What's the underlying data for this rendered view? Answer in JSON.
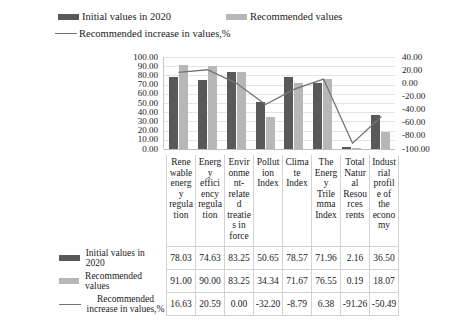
{
  "legend": {
    "items": [
      {
        "label": "Initial values in 2020",
        "marker": "bar-swatch-dark",
        "color": "#595959"
      },
      {
        "label": "Recommended values",
        "marker": "bar-swatch-light",
        "color": "#b7b7b7"
      },
      {
        "label": "Recommended increase in values,%",
        "marker": "line-swatch",
        "color": "#737373"
      }
    ]
  },
  "table": {
    "row_headers": [
      "Initial values in 2020",
      "Recommended values",
      "Recommended increase in values,%"
    ]
  },
  "chart_data": {
    "type": "bar",
    "title": "",
    "xlabel": "",
    "ylabel": "",
    "grid": true,
    "legend_position": "top",
    "categories": [
      "Renewable energy regulation",
      "Energy efficiency regulation",
      "Environment-related treaties in force",
      "Pollution Index",
      "Climate Index",
      "The Energy Trilemma Index",
      "Total Natural Resources rents",
      "Industrial profile of the economy"
    ],
    "category_labels_wrapped": [
      "Rene\nwable\nenerg\ny\nregula\ntion",
      "Energ\ny\neffici\nency\nregula\ntion",
      "Envir\nonme\nnt-\nrelate\nd\ntreatie\ns in\nforce",
      "Pollut\nion\nIndex",
      "Clima\nte\nIndex",
      "The\nEnerg\ny\nTrile\nmma\nIndex",
      "Total\nNatur\nal\nResou\nrces\nrents",
      "Indust\nrial\nprofil\ne of\nthe\necono\nmy"
    ],
    "series": [
      {
        "name": "Initial values in 2020",
        "type": "bar",
        "axis": "left",
        "color": "#595959",
        "values": [
          78.03,
          74.63,
          83.25,
          50.65,
          78.57,
          71.96,
          2.16,
          36.5
        ]
      },
      {
        "name": "Recommended values",
        "type": "bar",
        "axis": "left",
        "color": "#b7b7b7",
        "values": [
          91.0,
          90.0,
          83.25,
          34.34,
          71.67,
          76.55,
          0.19,
          18.07
        ]
      },
      {
        "name": "Recommended increase in values,%",
        "type": "line",
        "axis": "right",
        "color": "#737373",
        "values": [
          16.63,
          20.59,
          0.0,
          -32.2,
          -8.79,
          6.38,
          -91.26,
          -50.49
        ]
      }
    ],
    "left_axis": {
      "min": 0.0,
      "max": 100.0,
      "step": 10.0,
      "ticks": [
        "100.00",
        "90.00",
        "80.00",
        "70.00",
        "60.00",
        "50.00",
        "40.00",
        "30.00",
        "20.00",
        "10.00",
        "0.00"
      ]
    },
    "right_axis": {
      "min": -100.0,
      "max": 40.0,
      "step": 20.0,
      "ticks": [
        "40.00",
        "20.00",
        "0.00",
        "-20.00",
        "-40.00",
        "-60.00",
        "-80.00",
        "-100.00"
      ]
    }
  }
}
